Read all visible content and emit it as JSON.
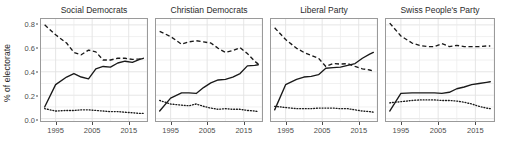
{
  "chart_data": {
    "type": "line",
    "title": "",
    "xlabel": "",
    "ylabel": "% of electorate",
    "xlim": [
      1991,
      2020
    ],
    "ylim": [
      -0.02,
      0.85
    ],
    "grid": true,
    "legend": "none",
    "x_ticks": [
      "1995",
      "2005",
      "2015"
    ],
    "x_tick_values": [
      1995,
      2005,
      2015
    ],
    "y_ticks": [
      "0.0",
      "0.2",
      "0.4",
      "0.6",
      "0.8"
    ],
    "y_tick_values": [
      0.0,
      0.2,
      0.4,
      0.6,
      0.8
    ],
    "facet_titles": [
      "Social Democrats",
      "Christian Democrats",
      "Liberal Party",
      "Swiss People's Party"
    ],
    "line_styles": [
      "solid",
      "dashed",
      "dotted"
    ],
    "line_color": "#1a1a1a",
    "x": [
      1992,
      1995,
      1998,
      2000,
      2002,
      2004,
      2006,
      2008,
      2010,
      2012,
      2014,
      2016,
      2018,
      2019
    ],
    "panels": [
      {
        "facet": "Social Democrats",
        "series": [
          {
            "name": "solid",
            "values": [
              0.1,
              0.29,
              0.355,
              0.385,
              0.355,
              0.34,
              0.425,
              0.445,
              0.44,
              0.475,
              0.49,
              0.48,
              0.505,
              0.515
            ]
          },
          {
            "name": "dashed",
            "values": [
              0.8,
              0.715,
              0.645,
              0.565,
              0.545,
              0.585,
              0.57,
              0.5,
              0.5,
              0.515,
              0.515,
              0.505,
              0.51,
              0.515
            ]
          },
          {
            "name": "dotted",
            "values": [
              0.085,
              0.065,
              0.07,
              0.07,
              0.075,
              0.075,
              0.07,
              0.065,
              0.06,
              0.06,
              0.055,
              0.05,
              0.045,
              0.045
            ]
          }
        ]
      },
      {
        "facet": "Christian Democrats",
        "series": [
          {
            "name": "solid",
            "values": [
              0.065,
              0.175,
              0.22,
              0.22,
              0.215,
              0.265,
              0.305,
              0.33,
              0.335,
              0.355,
              0.385,
              0.45,
              0.455,
              0.46
            ]
          },
          {
            "name": "dashed",
            "values": [
              0.745,
              0.7,
              0.635,
              0.655,
              0.665,
              0.655,
              0.645,
              0.6,
              0.565,
              0.58,
              0.605,
              0.555,
              0.49,
              0.465
            ]
          },
          {
            "name": "dotted",
            "values": [
              0.155,
              0.125,
              0.115,
              0.11,
              0.125,
              0.105,
              0.09,
              0.08,
              0.085,
              0.08,
              0.08,
              0.07,
              0.065,
              0.06
            ]
          }
        ]
      },
      {
        "facet": "Liberal Party",
        "series": [
          {
            "name": "solid",
            "values": [
              0.075,
              0.29,
              0.335,
              0.355,
              0.36,
              0.375,
              0.43,
              0.435,
              0.44,
              0.455,
              0.47,
              0.515,
              0.55,
              0.565
            ]
          },
          {
            "name": "dashed",
            "values": [
              0.775,
              0.675,
              0.6,
              0.565,
              0.54,
              0.515,
              0.445,
              0.47,
              0.465,
              0.47,
              0.445,
              0.425,
              0.415,
              0.405
            ]
          },
          {
            "name": "dotted",
            "values": [
              0.105,
              0.095,
              0.085,
              0.085,
              0.085,
              0.09,
              0.09,
              0.09,
              0.085,
              0.085,
              0.075,
              0.065,
              0.06,
              0.055
            ]
          }
        ]
      },
      {
        "facet": "Swiss People's Party",
        "series": [
          {
            "name": "solid",
            "values": [
              0.065,
              0.215,
              0.22,
              0.22,
              0.22,
              0.22,
              0.215,
              0.225,
              0.255,
              0.27,
              0.29,
              0.3,
              0.31,
              0.315
            ]
          },
          {
            "name": "dashed",
            "values": [
              0.815,
              0.705,
              0.645,
              0.625,
              0.615,
              0.615,
              0.64,
              0.615,
              0.625,
              0.615,
              0.615,
              0.615,
              0.62,
              0.62
            ]
          },
          {
            "name": "dotted",
            "values": [
              0.135,
              0.145,
              0.155,
              0.16,
              0.16,
              0.16,
              0.155,
              0.155,
              0.15,
              0.14,
              0.125,
              0.105,
              0.09,
              0.085
            ]
          }
        ]
      }
    ]
  },
  "axes": {
    "y_label": "% of electorate"
  }
}
